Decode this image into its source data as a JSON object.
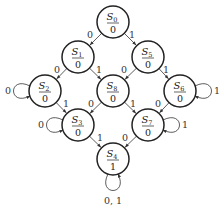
{
  "diagram": {
    "type": "state-transition-diagram",
    "radius": 16,
    "stroke_color": "#222222",
    "states": [
      {
        "id": "S0",
        "name": "S",
        "sub": "0",
        "output": "0",
        "x": 113,
        "y": 22
      },
      {
        "id": "S1",
        "name": "S",
        "sub": "1",
        "output": "0",
        "x": 78,
        "y": 57
      },
      {
        "id": "S5",
        "name": "S",
        "sub": "5",
        "output": "0",
        "x": 148,
        "y": 57
      },
      {
        "id": "S2",
        "name": "S",
        "sub": "2",
        "output": "0",
        "x": 45,
        "y": 91
      },
      {
        "id": "S8",
        "name": "S",
        "sub": "8",
        "output": "0",
        "x": 113,
        "y": 91
      },
      {
        "id": "S6",
        "name": "S",
        "sub": "6",
        "output": "0",
        "x": 180,
        "y": 91
      },
      {
        "id": "S3",
        "name": "S",
        "sub": "3",
        "output": "0",
        "x": 78,
        "y": 125
      },
      {
        "id": "S7",
        "name": "S",
        "sub": "7",
        "output": "0",
        "x": 148,
        "y": 125
      },
      {
        "id": "S4",
        "name": "S",
        "sub": "4",
        "output": "1",
        "x": 113,
        "y": 159
      }
    ],
    "transitions": [
      {
        "from": "S0",
        "to": "S1",
        "label": "0",
        "lx": 90,
        "ly": 35
      },
      {
        "from": "S0",
        "to": "S5",
        "label": "1",
        "lx": 132,
        "ly": 35
      },
      {
        "from": "S1",
        "to": "S2",
        "label": "0",
        "lx": 57,
        "ly": 70
      },
      {
        "from": "S1",
        "to": "S8",
        "label": "1",
        "lx": 99,
        "ly": 70
      },
      {
        "from": "S5",
        "to": "S8",
        "label": "0",
        "lx": 124,
        "ly": 70
      },
      {
        "from": "S5",
        "to": "S6",
        "label": "1",
        "lx": 166,
        "ly": 70
      },
      {
        "from": "S2",
        "to": "S3",
        "label": "1",
        "lx": 66,
        "ly": 104
      },
      {
        "from": "S8",
        "to": "S3",
        "label": "0",
        "lx": 91,
        "ly": 104
      },
      {
        "from": "S8",
        "to": "S7",
        "label": "1",
        "lx": 133,
        "ly": 104
      },
      {
        "from": "S6",
        "to": "S7",
        "label": "0",
        "lx": 158,
        "ly": 104
      },
      {
        "from": "S3",
        "to": "S4",
        "label": "1",
        "lx": 100,
        "ly": 138
      },
      {
        "from": "S7",
        "to": "S4",
        "label": "0",
        "lx": 125,
        "ly": 138
      }
    ],
    "self_loops": [
      {
        "state": "S2",
        "label": "0",
        "side": "left"
      },
      {
        "state": "S3",
        "label": "0",
        "side": "left"
      },
      {
        "state": "S6",
        "label": "1",
        "side": "right"
      },
      {
        "state": "S7",
        "label": "1",
        "side": "right"
      },
      {
        "state": "S4",
        "label": "0, 1",
        "side": "bottom"
      }
    ]
  }
}
